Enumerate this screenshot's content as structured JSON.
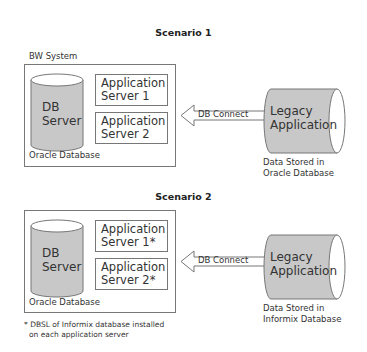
{
  "scenarios": [
    {
      "title": "Scenario 1",
      "system_label": "BW System",
      "db_server": {
        "line1": "DB",
        "line2": "Server"
      },
      "app_servers": [
        {
          "line1": "Application",
          "line2": "Server 1"
        },
        {
          "line1": "Application",
          "line2": "Server 2"
        }
      ],
      "database_label": "Oracle Database",
      "connector_label": "DB Connect",
      "legacy": {
        "line1": "Legacy",
        "line2": "Application"
      },
      "legacy_caption": {
        "line1": "Data Stored in",
        "line2": "Oracle Database"
      }
    },
    {
      "title": "Scenario 2",
      "db_server": {
        "line1": "DB",
        "line2": "Server"
      },
      "app_servers": [
        {
          "line1": "Application",
          "line2": "Server 1*"
        },
        {
          "line1": "Application",
          "line2": "Server 2*"
        }
      ],
      "database_label": "Oracle Database",
      "connector_label": "DB Connect",
      "legacy": {
        "line1": "Legacy",
        "line2": "Application"
      },
      "legacy_caption": {
        "line1": "Data Stored in",
        "line2": "Informix Database"
      },
      "footnote": {
        "line1": "* DBSL of Informix database installed",
        "line2": "on each application server"
      }
    }
  ],
  "colors": {
    "cylinder_fill": "#c8c8c8",
    "stroke": "#777777",
    "background": "#ffffff"
  }
}
